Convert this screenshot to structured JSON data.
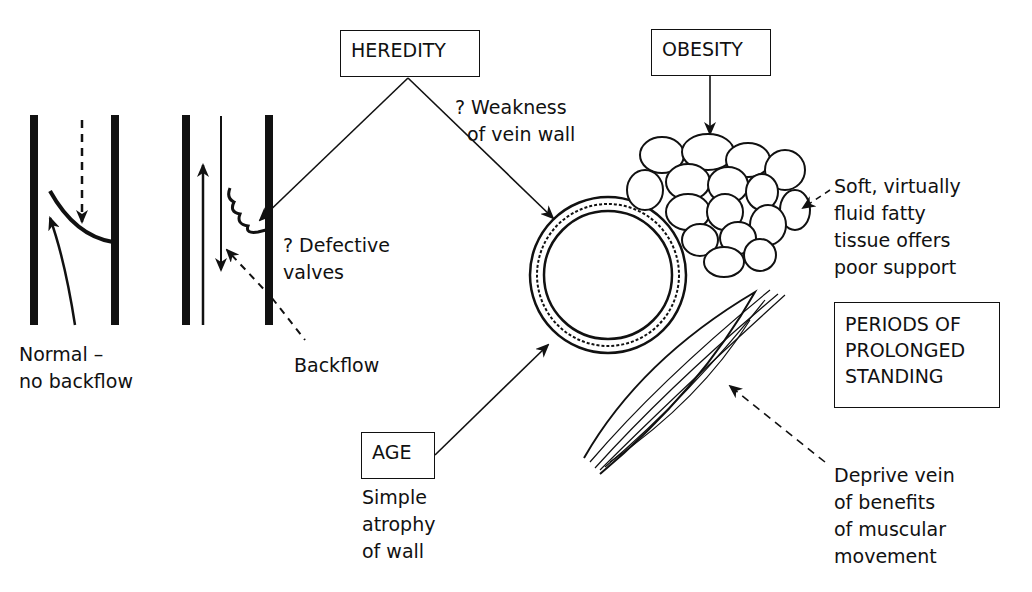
{
  "diagram": {
    "type": "causes of varicose veins",
    "boxes": {
      "heredity": "HEREDITY",
      "obesity": "OBESITY",
      "age": "AGE",
      "standing": [
        "PERIODS OF",
        "PROLONGED",
        "STANDING"
      ]
    },
    "labels": {
      "weakness": [
        "? Weakness",
        "of vein wall"
      ],
      "defective": [
        "? Defective",
        "valves"
      ],
      "normal": [
        "Normal –",
        "no backflow"
      ],
      "backflow": "Backflow",
      "fatty": [
        "Soft, virtually",
        "fluid fatty",
        "tissue offers",
        "poor support"
      ],
      "age_note": [
        "Simple",
        "atrophy",
        "of wall"
      ],
      "muscle_note": [
        "Deprive vein",
        "of benefits",
        "of muscular",
        "movement"
      ]
    },
    "icons": [
      "normal-vein-valve-icon",
      "defective-vein-valve-icon",
      "vein-cross-section-icon",
      "fat-cells-icon",
      "muscle-icon"
    ],
    "colors": {
      "ink": "#111111",
      "background": "#ffffff"
    }
  }
}
